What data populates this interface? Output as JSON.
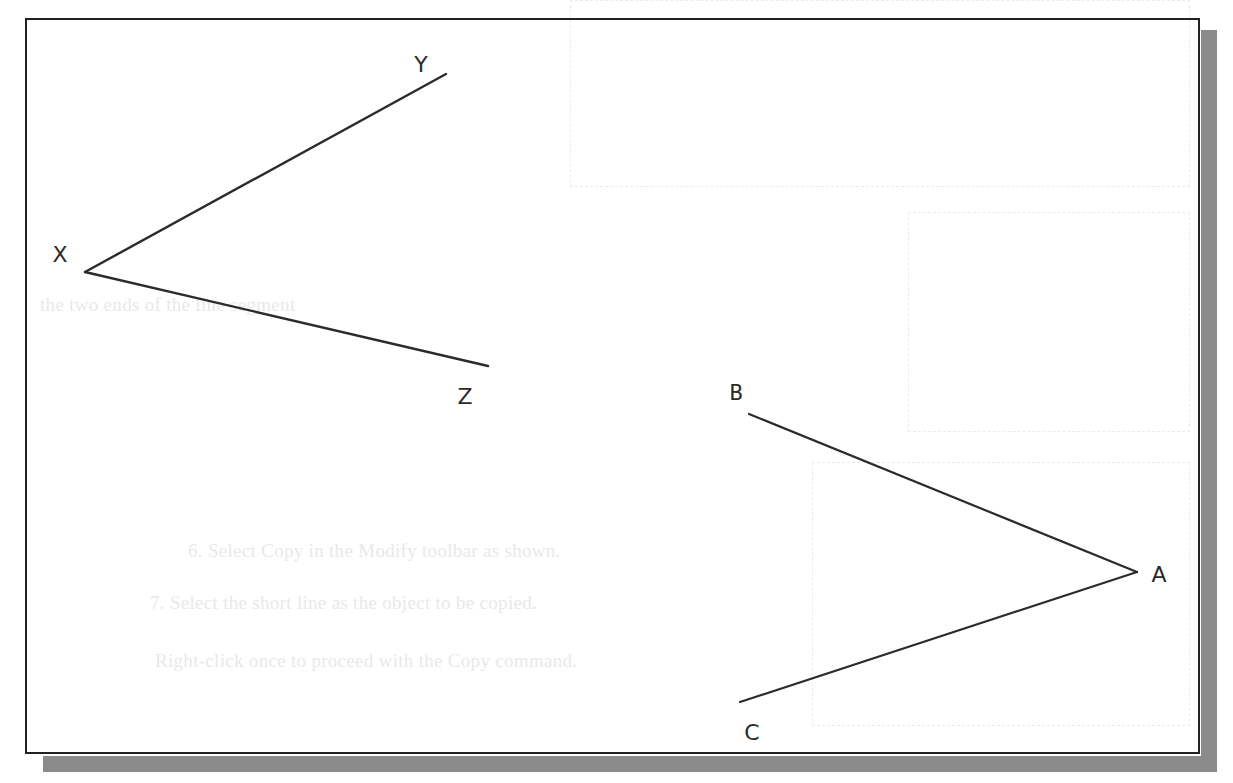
{
  "figure": {
    "frame": {
      "border_color": "#222222",
      "shadow_color": "#8b8b8b",
      "background": "#ffffff"
    },
    "line_color": "#2b2b2b",
    "angles": [
      {
        "name": "angle-XYZ",
        "vertex": {
          "label": "X",
          "point": [
            85,
            272
          ],
          "label_pos": [
            60,
            262
          ]
        },
        "rays": [
          {
            "label": "Y",
            "end": [
              446,
              74
            ],
            "label_pos": [
              421,
              72
            ]
          },
          {
            "label": "Z",
            "end": [
              488,
              366
            ],
            "label_pos": [
              465,
              404
            ]
          }
        ]
      },
      {
        "name": "angle-BAC",
        "vertex": {
          "label": "A",
          "point": [
            1137,
            572
          ],
          "label_pos": [
            1159,
            582
          ]
        },
        "rays": [
          {
            "label": "B",
            "end": [
              749,
              414
            ],
            "label_pos": [
              736,
              400
            ]
          },
          {
            "label": "C",
            "end": [
              740,
              702
            ],
            "label_pos": [
              752,
              740
            ]
          }
        ]
      }
    ]
  },
  "bleed_through_text": [
    "the two ends of the line segment",
    "6.  Select Copy in the Modify toolbar as shown.",
    "7.  Select the short line as the object to be copied.",
    "Right-click once to proceed with the Copy command."
  ]
}
